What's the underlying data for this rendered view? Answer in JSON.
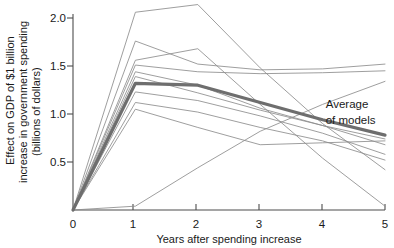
{
  "chart_data": {
    "type": "line",
    "title": "",
    "xlabel": "Years after spending increase",
    "ylabel": "Effect on GDP of $1 billion increase in government spending (billions of dollars)",
    "ylabel_line1": "Effect on GDP of $1 billion",
    "ylabel_line2": "increase in government spending",
    "ylabel_line3": "(billions of dollars)",
    "x": [
      0,
      1,
      2,
      3,
      4,
      5
    ],
    "xlim": [
      0,
      5
    ],
    "ylim": [
      0,
      2.15
    ],
    "xticks": [
      "0",
      "1",
      "2",
      "3",
      "4",
      "5"
    ],
    "xtick_values": [
      0,
      1,
      2,
      3,
      4,
      5
    ],
    "yticks": [
      "0.5",
      "1.0",
      "1.5",
      "2.0"
    ],
    "ytick_values": [
      0.5,
      1.0,
      1.5,
      2.0
    ],
    "grid": false,
    "legend": "none",
    "annotations": [
      {
        "name": "average-of-models-label",
        "line1": "Average",
        "line2": "of models",
        "x": 4.05,
        "y": 1.06
      }
    ],
    "series": [
      {
        "name": "model-1",
        "values": [
          0.0,
          2.06,
          2.14,
          1.48,
          0.9,
          0.42
        ],
        "style": "thin"
      },
      {
        "name": "model-2",
        "values": [
          0.0,
          1.76,
          1.52,
          1.46,
          1.47,
          1.52
        ],
        "style": "thin"
      },
      {
        "name": "model-3",
        "values": [
          0.0,
          1.56,
          1.68,
          1.1,
          0.54,
          0.04
        ],
        "style": "thin"
      },
      {
        "name": "model-4",
        "values": [
          0.0,
          1.51,
          1.44,
          1.42,
          1.43,
          1.45
        ],
        "style": "thin"
      },
      {
        "name": "model-5",
        "values": [
          0.0,
          1.44,
          1.3,
          1.06,
          0.88,
          0.68
        ],
        "style": "thin"
      },
      {
        "name": "model-6",
        "values": [
          0.0,
          1.39,
          1.22,
          1.04,
          0.88,
          0.74
        ],
        "style": "thin"
      },
      {
        "name": "model-7",
        "values": [
          0.0,
          1.23,
          1.14,
          0.98,
          0.8,
          0.58
        ],
        "style": "thin"
      },
      {
        "name": "model-8",
        "values": [
          0.0,
          1.12,
          1.02,
          0.86,
          0.72,
          0.52
        ],
        "style": "thin"
      },
      {
        "name": "model-9",
        "values": [
          0.0,
          1.05,
          0.86,
          0.68,
          0.7,
          0.72
        ],
        "style": "thin"
      },
      {
        "name": "model-10",
        "values": [
          0.0,
          0.04,
          0.44,
          0.82,
          1.1,
          1.34
        ],
        "style": "thin"
      },
      {
        "name": "average-of-models",
        "values": [
          0.0,
          1.32,
          1.3,
          1.12,
          0.94,
          0.78
        ],
        "style": "thick"
      }
    ]
  }
}
